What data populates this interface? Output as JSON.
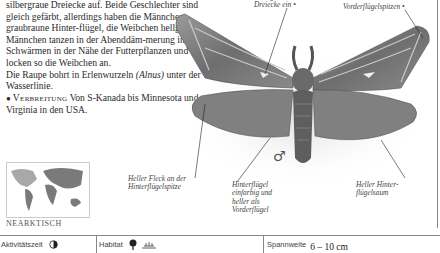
{
  "body_text": {
    "line0": "silbergraue Dreiecke auf. Beide Geschlechter sind gleich gefärbt, allerdings haben die Männchen graubraune Hinter-flügel, die Weibchen hellgelbe. Männchen tanzen in der Abenddäm-merung in Schwärmen in der Nähe der Futterpflanzen und locken so die Weibchen an.",
    "caterpillar_pre": "Die Raupe bohrt in Erlenwurzeln ",
    "caterpillar_genus": "(Alnus)",
    "caterpillar_post": " unter der Wasserlinie.",
    "distribution_label": "Verbreitung",
    "distribution_text": " Von S-Kanada bis Minnesota und Virginia in den USA."
  },
  "annotations": {
    "silver_triangles": "silbergrauen\nDreiecke ein",
    "forewing_tips": "Vorderflügelspitzen",
    "hindwing_tip_spot": "Heller Fleck an der\nHinterflügelspitze",
    "hindwing_plain": "Hinterflügel\neinfarbig und\nheller als\nVorderflügel",
    "hindwing_margin": "Heller Hinter-\nflügelsaum"
  },
  "sex_symbol": "♂",
  "map": {
    "region_label": "NEARKTISCH"
  },
  "footer": {
    "activity_label": "Aktivitätszeit",
    "activity_icon": "half-moon-icon",
    "habitat_label": "Habitat",
    "habitat_icons": [
      "deciduous-tree-icon",
      "wetland-icon"
    ],
    "wingspan_label": "Spannweite",
    "wingspan_value": "6 – 10 cm"
  },
  "colors": {
    "text": "#2a2a2a",
    "rule": "#888888",
    "map_land": "#7a7a7a",
    "map_highlight": "#a8a8a8"
  }
}
